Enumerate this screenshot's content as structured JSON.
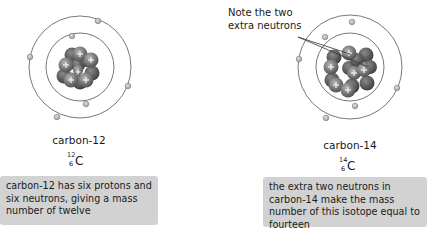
{
  "left_atom": {
    "name": "carbon-12",
    "symbol": {
      "mass_number": "12",
      "atomic_number": "6",
      "element": "C"
    },
    "protons": 6,
    "neutrons": 6,
    "electrons": 6,
    "description": "carbon-12 has six protons and six neutrons, giving a mass number of twelve"
  },
  "right_atom": {
    "name": "carbon-14",
    "symbol": {
      "mass_number": "14",
      "atomic_number": "6",
      "element": "C"
    },
    "protons": 6,
    "neutrons": 8,
    "electrons": 6,
    "description": "the extra two neutrons in carbon-14 make the mass number of this isotope equal to fourteen",
    "annotation": "Note the two extra neutrons"
  },
  "colors": {
    "orbit": "#555555",
    "electron_fill": "#bdbdbd",
    "nucleon_dark": "#5a5a5a",
    "nucleon_light": "#a8a8a8",
    "info_box_bg": "#d2d2d2"
  }
}
